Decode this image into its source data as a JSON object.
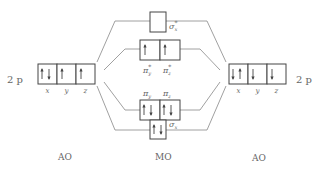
{
  "colors": {
    "line": "#888888",
    "box": "#444444",
    "arrow": "#444444",
    "text": "#666666"
  },
  "left_atom": {
    "level_label": "2 p",
    "column_label": "AO",
    "orbitals": [
      {
        "axis": "x",
        "electrons": [
          "up",
          "down"
        ]
      },
      {
        "axis": "y",
        "electrons": [
          "up"
        ]
      },
      {
        "axis": "z",
        "electrons": [
          "up"
        ]
      }
    ]
  },
  "right_atom": {
    "level_label": "2 p",
    "column_label": "AO",
    "orbitals": [
      {
        "axis": "x",
        "electrons": [
          "down",
          "up"
        ]
      },
      {
        "axis": "y",
        "electrons": [
          "down"
        ]
      },
      {
        "axis": "z",
        "electrons": [
          "down"
        ]
      }
    ]
  },
  "molecule": {
    "column_label": "MO",
    "levels": [
      {
        "id": "sigma-star-x",
        "orbitals": [
          {
            "label": "σ",
            "sup": "*",
            "sub": "x",
            "electrons": []
          }
        ]
      },
      {
        "id": "pi-star",
        "orbitals": [
          {
            "label": "π",
            "sup": "*",
            "sub": "y",
            "electrons": [
              "up"
            ]
          },
          {
            "label": "π",
            "sup": "*",
            "sub": "z",
            "electrons": [
              "up"
            ]
          }
        ]
      },
      {
        "id": "pi",
        "orbitals": [
          {
            "label": "π",
            "sup": "",
            "sub": "y",
            "electrons": [
              "up",
              "down"
            ]
          },
          {
            "label": "π",
            "sup": "",
            "sub": "z",
            "electrons": [
              "up",
              "down"
            ]
          }
        ]
      },
      {
        "id": "sigma-x",
        "orbitals": [
          {
            "label": "σ",
            "sup": "",
            "sub": "x",
            "electrons": [
              "up",
              "down"
            ]
          }
        ]
      }
    ]
  }
}
